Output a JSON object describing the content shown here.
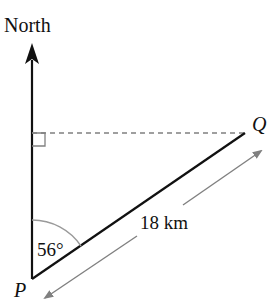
{
  "diagram": {
    "type": "bearing-diagram",
    "north_label": "North",
    "point_start": "P",
    "point_end": "Q",
    "distance_label": "18 km",
    "angle_label": "56°",
    "angle_degrees": 56,
    "distance_km": 18,
    "right_angle_marker": true,
    "colors": {
      "line": "#111111",
      "arrow": "#808080",
      "dashed": "#808080",
      "arc": "#9a9a9a"
    }
  }
}
